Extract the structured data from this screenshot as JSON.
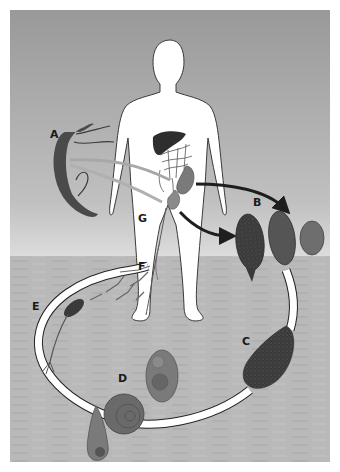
{
  "diagram": {
    "labels": {
      "A": "A",
      "B": "B",
      "C": "C",
      "D": "D",
      "E": "E",
      "F": "F",
      "G": "G"
    },
    "colors": {
      "sky_top": "#9a9a9a",
      "sky_bottom": "#d4d4d4",
      "water": "#b8b8b8",
      "body": "#ffffff",
      "outline": "#3a3a3a",
      "dark_organ": "#2e2e2e",
      "arrow": "#1e1e1e",
      "cycle_band": "#ffffff",
      "worm": "#4a4a4a",
      "egg_dark": "#3d3d3d",
      "egg_mid": "#555555",
      "egg_light": "#6e6e6e",
      "snail": "#6a6a6a"
    }
  }
}
